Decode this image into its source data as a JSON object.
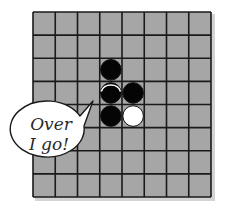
{
  "game": {
    "name": "Othello",
    "board": {
      "rows": 8,
      "cols": 8,
      "cell_color": "#a6a6a6",
      "line_color": "#1a1a1a",
      "shadow_color": "#cfcfcf"
    },
    "pieces": [
      {
        "row": 2,
        "col": 3,
        "color": "black",
        "state": "placed"
      },
      {
        "row": 3,
        "col": 3,
        "color": "black",
        "state": "flipping"
      },
      {
        "row": 3,
        "col": 4,
        "color": "black",
        "state": "placed"
      },
      {
        "row": 4,
        "col": 3,
        "color": "black",
        "state": "placed"
      },
      {
        "row": 4,
        "col": 4,
        "color": "white",
        "state": "placed"
      }
    ],
    "speech_bubble": {
      "line1": "Over",
      "line2": "I go!"
    }
  }
}
